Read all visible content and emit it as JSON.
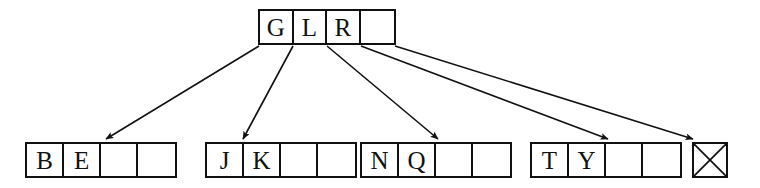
{
  "diagram": {
    "type": "b-tree",
    "colors": {
      "background": "#ffffff",
      "stroke": "#111111",
      "text": "#111111"
    },
    "root": {
      "label": "root-node",
      "order": 4,
      "cells": [
        {
          "value": "G",
          "empty": false
        },
        {
          "value": "L",
          "empty": false
        },
        {
          "value": "R",
          "empty": false
        },
        {
          "value": "",
          "empty": true
        }
      ]
    },
    "leaves": [
      {
        "label": "leaf-node-0",
        "cells": [
          {
            "value": "B",
            "empty": false
          },
          {
            "value": "E",
            "empty": false
          },
          {
            "value": "",
            "empty": true
          },
          {
            "value": "",
            "empty": true
          }
        ]
      },
      {
        "label": "leaf-node-1",
        "cells": [
          {
            "value": "J",
            "empty": false
          },
          {
            "value": "K",
            "empty": false
          },
          {
            "value": "",
            "empty": true
          },
          {
            "value": "",
            "empty": true
          }
        ]
      },
      {
        "label": "leaf-node-2",
        "cells": [
          {
            "value": "N",
            "empty": false
          },
          {
            "value": "Q",
            "empty": false
          },
          {
            "value": "",
            "empty": true
          },
          {
            "value": "",
            "empty": true
          }
        ]
      },
      {
        "label": "leaf-node-3",
        "cells": [
          {
            "value": "T",
            "empty": false
          },
          {
            "value": "Y",
            "empty": false
          },
          {
            "value": "",
            "empty": true
          },
          {
            "value": "",
            "empty": true
          }
        ]
      }
    ],
    "null_node": {
      "label": "null-pointer-node",
      "marker": "crossed-box",
      "value": ""
    },
    "edges": [
      {
        "name": "edge-root-to-leaf-0",
        "from": "root-cell-0-left",
        "to": "leaf-node-0"
      },
      {
        "name": "edge-root-to-leaf-1",
        "from": "root-divider-0-1",
        "to": "leaf-node-1"
      },
      {
        "name": "edge-root-to-leaf-2",
        "from": "root-divider-1-2",
        "to": "leaf-node-2"
      },
      {
        "name": "edge-root-to-leaf-3",
        "from": "root-divider-2-3",
        "to": "leaf-node-3"
      },
      {
        "name": "edge-root-to-null",
        "from": "root-cell-3-right",
        "to": "null-pointer-node"
      }
    ]
  }
}
